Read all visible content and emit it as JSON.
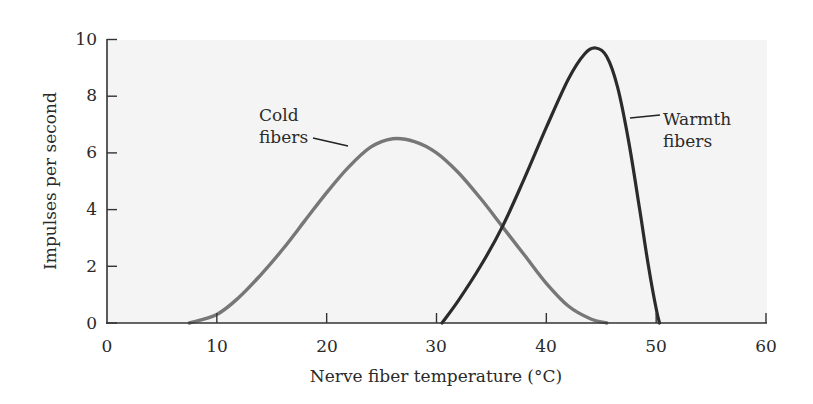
{
  "chart_data": {
    "type": "line",
    "title": "",
    "xlabel": "Nerve fiber temperature (°C)",
    "ylabel": "Impulses per second",
    "xlim": [
      0,
      60
    ],
    "ylim": [
      0,
      10
    ],
    "xticks": [
      0,
      10,
      20,
      30,
      40,
      50,
      60
    ],
    "yticks": [
      0,
      2,
      4,
      6,
      8,
      10
    ],
    "grid": false,
    "legend": "none (inline annotations)",
    "series": [
      {
        "name": "Cold fibers",
        "color": "#777777",
        "x": [
          7.5,
          10,
          12,
          14,
          16,
          18,
          20,
          22,
          24,
          26,
          28,
          30,
          32,
          34,
          36,
          38,
          40,
          42,
          44,
          45.5
        ],
        "y": [
          0,
          0.3,
          0.9,
          1.7,
          2.6,
          3.6,
          4.6,
          5.5,
          6.2,
          6.5,
          6.4,
          6.0,
          5.3,
          4.4,
          3.4,
          2.4,
          1.4,
          0.6,
          0.15,
          0
        ]
      },
      {
        "name": "Warmth fibers",
        "color": "#2b2b2b",
        "x": [
          30.5,
          32,
          34,
          36,
          38,
          40,
          42,
          43.5,
          44.5,
          45.5,
          46.5,
          47.5,
          48.5,
          49.3,
          50,
          50.3
        ],
        "y": [
          0,
          0.8,
          2.0,
          3.4,
          5.1,
          6.9,
          8.6,
          9.5,
          9.7,
          9.4,
          8.3,
          6.4,
          4.0,
          2.0,
          0.5,
          0
        ]
      }
    ],
    "annotations": [
      {
        "text_lines": [
          "Cold",
          "fibers"
        ],
        "points_to": "Cold fibers",
        "at": [
          22,
          6.1
        ]
      },
      {
        "text_lines": [
          "Warmth",
          "fibers"
        ],
        "points_to": "Warmth fibers",
        "at": [
          47.4,
          6.4
        ]
      }
    ]
  },
  "labels": {
    "xlabel": "Nerve fiber temperature (°C)",
    "ylabel": "Impulses per second",
    "cold_line1": "Cold",
    "cold_line2": "fibers",
    "warm_line1": "Warmth",
    "warm_line2": "fibers",
    "xticks": [
      "0",
      "10",
      "20",
      "30",
      "40",
      "50",
      "60"
    ],
    "yticks": [
      "0",
      "2",
      "4",
      "6",
      "8",
      "10"
    ]
  },
  "colors": {
    "plot_bg": "#f4f4f4",
    "axis": "#333333",
    "cold": "#777777",
    "warm": "#2b2b2b"
  }
}
